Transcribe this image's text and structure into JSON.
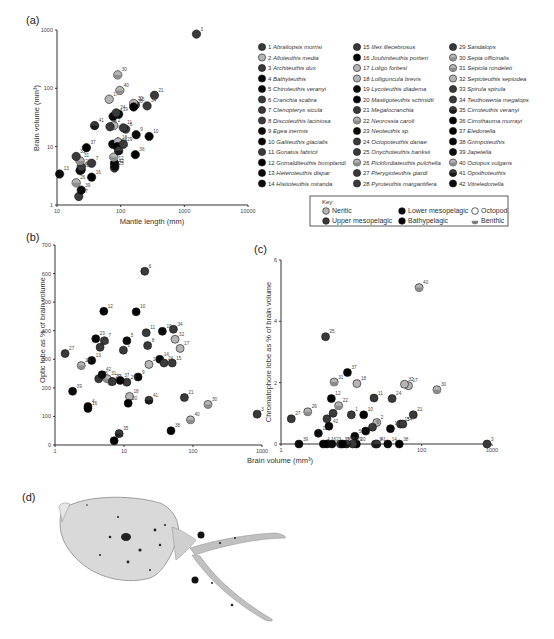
{
  "figure": {
    "panel_labels": {
      "a": "(a)",
      "b": "(b)",
      "c": "(c)",
      "d": "(d)"
    }
  },
  "colors": {
    "neritic": "#b5b5b5",
    "upper_mesopelagic": "#3a3a3a",
    "lower_mesopelagic": "#0a0a0a",
    "bathypelagic": "#000000",
    "outline": "#111111"
  },
  "legend": {
    "species": [
      {
        "n": 1,
        "name": "Abraliopsis morrisi",
        "habitat": "upper"
      },
      {
        "n": 2,
        "name": "Alloteuthis media",
        "habitat": "neritic"
      },
      {
        "n": 3,
        "name": "Architeuthis dux",
        "habitat": "upper"
      },
      {
        "n": 4,
        "name": "Bathyteuthis",
        "habitat": "bathy"
      },
      {
        "n": 5,
        "name": "Chiroteuthis veranyi",
        "habitat": "lower"
      },
      {
        "n": 6,
        "name": "Cranchia scabra",
        "habitat": "upper"
      },
      {
        "n": 7,
        "name": "Ctenopteryx sicula",
        "habitat": "upper"
      },
      {
        "n": 8,
        "name": "Discoteuthis laciniosa",
        "habitat": "upper"
      },
      {
        "n": 9,
        "name": "Egea inermis",
        "habitat": "lower"
      },
      {
        "n": 10,
        "name": "Galiteuthis glacialis",
        "habitat": "bathy"
      },
      {
        "n": 11,
        "name": "Gonatus fabricii",
        "habitat": "upper"
      },
      {
        "n": 12,
        "name": "Grimalditeuthis bomplandi",
        "habitat": "bathy"
      },
      {
        "n": 13,
        "name": "Heteroteuthis dispar",
        "habitat": "lower"
      },
      {
        "n": 14,
        "name": "Histioteuthis miranda",
        "habitat": "lower"
      },
      {
        "n": 15,
        "name": "Illex illecebrosus",
        "habitat": "upper"
      },
      {
        "n": 16,
        "name": "Joubiniteuthis portieri",
        "habitat": "bathy"
      },
      {
        "n": 17,
        "name": "Loligo forbesi",
        "habitat": "neritic"
      },
      {
        "n": 18,
        "name": "Lolliguncula brevis",
        "habitat": "neritic"
      },
      {
        "n": 19,
        "name": "Lycoteuthis diadema",
        "habitat": "lower"
      },
      {
        "n": 20,
        "name": "Mastigoteuthis schmidti",
        "habitat": "bathy"
      },
      {
        "n": 21,
        "name": "Megalocranchia",
        "habitat": "upper"
      },
      {
        "n": 22,
        "name": "Neorossia caroli",
        "habitat": "neritic-benthic"
      },
      {
        "n": 23,
        "name": "Neoteuthis sp.",
        "habitat": "lower"
      },
      {
        "n": 24,
        "name": "Octopoteuthis danae",
        "habitat": "upper"
      },
      {
        "n": 25,
        "name": "Onychoteuthis banksii",
        "habitat": "upper"
      },
      {
        "n": 26,
        "name": "Pickfordiateuthis pulchella",
        "habitat": "neritic-benthic"
      },
      {
        "n": 27,
        "name": "Pterygioteuthis giardi",
        "habitat": "upper"
      },
      {
        "n": 28,
        "name": "Pyroteuthis margaritifera",
        "habitat": "upper"
      },
      {
        "n": 29,
        "name": "Sandalops",
        "habitat": "upper"
      },
      {
        "n": 30,
        "name": "Sepia officinalis",
        "habitat": "neritic-benthic"
      },
      {
        "n": 31,
        "name": "Sepiola rondeleti",
        "habitat": "neritic-benthic"
      },
      {
        "n": 32,
        "name": "Sepioteuthis sepiodea",
        "habitat": "neritic"
      },
      {
        "n": 33,
        "name": "Spirula spirula",
        "habitat": "upper"
      },
      {
        "n": 34,
        "name": "Teuthowenia megalops",
        "habitat": "upper"
      },
      {
        "n": 35,
        "name": "Cirroteuthis veranyi",
        "habitat": "upper-benthic"
      },
      {
        "n": 36,
        "name": "Cirrothauma murrayi",
        "habitat": "bathy"
      },
      {
        "n": 37,
        "name": "Eledonella",
        "habitat": "bathy"
      },
      {
        "n": 38,
        "name": "Grimpoteuthis",
        "habitat": "bathy"
      },
      {
        "n": 39,
        "name": "Japetella",
        "habitat": "lower"
      },
      {
        "n": 40,
        "name": "Octopus vulgaris",
        "habitat": "neritic-benthic"
      },
      {
        "n": 41,
        "name": "Opisthoteuthis",
        "habitat": "upper-benthic"
      },
      {
        "n": 42,
        "name": "Vitreledonella",
        "habitat": "lower"
      }
    ],
    "key": {
      "title": "Key:",
      "items": [
        {
          "label": "Neritic",
          "style": "neritic"
        },
        {
          "label": "Lower mesopelagic",
          "style": "lower"
        },
        {
          "label": "Octopod",
          "style": "octopod"
        },
        {
          "label": "Upper mesopelagic",
          "style": "upper"
        },
        {
          "label": "Bathypelagic",
          "style": "bathy"
        },
        {
          "label": "Benthic",
          "style": "benthic"
        }
      ]
    }
  },
  "chart_data": [
    {
      "id": "a",
      "type": "scatter",
      "title": "(a)",
      "xlabel": "Mantle length (mm)",
      "ylabel": "Brain volume (mm³)",
      "xscale": "log",
      "yscale": "log",
      "xlim": [
        10,
        10000
      ],
      "ylim": [
        1,
        1000
      ],
      "xticks": [
        "10",
        "100",
        "1000",
        "10000"
      ],
      "yticks": [
        "1",
        "10",
        "100",
        "1000"
      ],
      "grid": false,
      "points": [
        {
          "n": 1,
          "x": 100,
          "y": 11
        },
        {
          "n": 2,
          "x": 78,
          "y": 23
        },
        {
          "n": 3,
          "x": 1550,
          "y": 850
        },
        {
          "n": 4,
          "x": 24,
          "y": 4
        },
        {
          "n": 5,
          "x": 75,
          "y": 11
        },
        {
          "n": 6,
          "x": 120,
          "y": 20
        },
        {
          "n": 7,
          "x": 35,
          "y": 5.2
        },
        {
          "n": 8,
          "x": 68,
          "y": 22
        },
        {
          "n": 9,
          "x": 175,
          "y": 16
        },
        {
          "n": 10,
          "x": 280,
          "y": 15
        },
        {
          "n": 11,
          "x": 110,
          "y": 21
        },
        {
          "n": 12,
          "x": 80,
          "y": 5.2
        },
        {
          "n": 13,
          "x": 11,
          "y": 3.4
        },
        {
          "n": 14,
          "x": 76,
          "y": 33
        },
        {
          "n": 15,
          "x": 170,
          "y": 52
        },
        {
          "n": 16,
          "x": 35,
          "y": 3
        },
        {
          "n": 17,
          "x": 66,
          "y": 65
        },
        {
          "n": 18,
          "x": 91,
          "y": 12
        },
        {
          "n": 19,
          "x": 93,
          "y": 36
        },
        {
          "n": 20,
          "x": 88,
          "y": 10
        },
        {
          "n": 21,
          "x": 340,
          "y": 76
        },
        {
          "n": 22,
          "x": 78,
          "y": 6.6
        },
        {
          "n": 23,
          "x": 23,
          "y": 3.9
        },
        {
          "n": 24,
          "x": 85,
          "y": 38
        },
        {
          "n": 25,
          "x": 80,
          "y": 4.3
        },
        {
          "n": 26,
          "x": 20,
          "y": 2.4
        },
        {
          "n": 27,
          "x": 22,
          "y": 1.4
        },
        {
          "n": 28,
          "x": 24,
          "y": 4.5
        },
        {
          "n": 29,
          "x": 110,
          "y": 11
        },
        {
          "n": 30,
          "x": 90,
          "y": 170
        },
        {
          "n": 31,
          "x": 23,
          "y": 5.7
        },
        {
          "n": 32,
          "x": 160,
          "y": 55
        },
        {
          "n": 33,
          "x": 20,
          "y": 6.8
        },
        {
          "n": 34,
          "x": 260,
          "y": 50
        },
        {
          "n": 35,
          "x": 93,
          "y": 8.5
        },
        {
          "n": 36,
          "x": 170,
          "y": 7.3
        },
        {
          "n": 37,
          "x": 29,
          "y": 9.6
        },
        {
          "n": 38,
          "x": 160,
          "y": 48
        },
        {
          "n": 39,
          "x": 24,
          "y": 1.8
        },
        {
          "n": 40,
          "x": 97,
          "y": 92
        },
        {
          "n": 41,
          "x": 39,
          "y": 23
        },
        {
          "n": 42,
          "x": 81,
          "y": 4.6
        }
      ]
    },
    {
      "id": "b",
      "type": "scatter",
      "title": "(b)",
      "xlabel": "Brain volume (mm³)",
      "ylabel": "Optic lobe as % of brain volume",
      "xscale": "log",
      "yscale": "linear",
      "xlim": [
        1,
        1000
      ],
      "ylim": [
        0,
        700
      ],
      "xticks": [
        "1",
        "10",
        "100",
        "1000"
      ],
      "yticks": [
        "0",
        "100",
        "200",
        "300",
        "400",
        "500",
        "600",
        "700"
      ],
      "grid": false,
      "points": [
        {
          "n": 1,
          "x": 9.8,
          "y": 332
        },
        {
          "n": 2,
          "x": 23,
          "y": 282
        },
        {
          "n": 3,
          "x": 850,
          "y": 108
        },
        {
          "n": 4,
          "x": 3,
          "y": 135
        },
        {
          "n": 5,
          "x": 11,
          "y": 365
        },
        {
          "n": 6,
          "x": 20,
          "y": 608
        },
        {
          "n": 7,
          "x": 5.2,
          "y": 365
        },
        {
          "n": 8,
          "x": 22,
          "y": 348
        },
        {
          "n": 9,
          "x": 16,
          "y": 238
        },
        {
          "n": 10,
          "x": 15,
          "y": 466
        },
        {
          "n": 11,
          "x": 21,
          "y": 393
        },
        {
          "n": 12,
          "x": 5.1,
          "y": 468
        },
        {
          "n": 13,
          "x": 3.4,
          "y": 296
        },
        {
          "n": 14,
          "x": 33,
          "y": 300
        },
        {
          "n": 15,
          "x": 50,
          "y": 287
        },
        {
          "n": 16,
          "x": 3,
          "y": 128
        },
        {
          "n": 17,
          "x": 65,
          "y": 338
        },
        {
          "n": 18,
          "x": 12,
          "y": 170
        },
        {
          "n": 19,
          "x": 36,
          "y": 398
        },
        {
          "n": 20,
          "x": 11.5,
          "y": 146
        },
        {
          "n": 21,
          "x": 75,
          "y": 166
        },
        {
          "n": 22,
          "x": 6.6,
          "y": 222
        },
        {
          "n": 23,
          "x": 3.9,
          "y": 372
        },
        {
          "n": 24,
          "x": 38,
          "y": 287
        },
        {
          "n": 25,
          "x": 4.3,
          "y": 232
        },
        {
          "n": 26,
          "x": 2.4,
          "y": 278
        },
        {
          "n": 27,
          "x": 1.4,
          "y": 320
        },
        {
          "n": 28,
          "x": 4.5,
          "y": 342
        },
        {
          "n": 29,
          "x": 11,
          "y": 220
        },
        {
          "n": 30,
          "x": 165,
          "y": 142
        },
        {
          "n": 31,
          "x": 5.7,
          "y": 232
        },
        {
          "n": 32,
          "x": 55,
          "y": 370
        },
        {
          "n": 33,
          "x": 6.8,
          "y": 222
        },
        {
          "n": 34,
          "x": 52,
          "y": 405
        },
        {
          "n": 35,
          "x": 8.5,
          "y": 40
        },
        {
          "n": 36,
          "x": 7.2,
          "y": 15
        },
        {
          "n": 37,
          "x": 8.8,
          "y": 226
        },
        {
          "n": 38,
          "x": 48,
          "y": 50
        },
        {
          "n": 39,
          "x": 1.8,
          "y": 188
        },
        {
          "n": 40,
          "x": 92,
          "y": 88
        },
        {
          "n": 41,
          "x": 23,
          "y": 157
        },
        {
          "n": 42,
          "x": 4.8,
          "y": 246
        }
      ]
    },
    {
      "id": "c",
      "type": "scatter",
      "title": "(c)",
      "xlabel": "Brain volume (mm³)",
      "ylabel": "Chromatophore lobe as % of brain volume",
      "xscale": "log",
      "yscale": "linear",
      "xlim": [
        1,
        1000
      ],
      "ylim": [
        0,
        6
      ],
      "xticks": [
        "1",
        "100",
        "1000"
      ],
      "yticks": [
        "0",
        "2",
        "4",
        "6"
      ],
      "grid": false,
      "points": [
        {
          "n": 1,
          "x": 10,
          "y": 0.95
        },
        {
          "n": 2,
          "x": 23,
          "y": 0.7
        },
        {
          "n": 3,
          "x": 850,
          "y": 0
        },
        {
          "n": 4,
          "x": 4,
          "y": 0
        },
        {
          "n": 5,
          "x": 11.2,
          "y": 0.25
        },
        {
          "n": 6,
          "x": 20,
          "y": 0.55
        },
        {
          "n": 7,
          "x": 5.5,
          "y": 1.0
        },
        {
          "n": 8,
          "x": 22,
          "y": 0
        },
        {
          "n": 9,
          "x": 16,
          "y": 0.42
        },
        {
          "n": 10,
          "x": 15,
          "y": 0.95
        },
        {
          "n": 11,
          "x": 21,
          "y": 1.5
        },
        {
          "n": 12,
          "x": 5.2,
          "y": 1.48
        },
        {
          "n": 13,
          "x": 3.4,
          "y": 0.35
        },
        {
          "n": 14,
          "x": 33,
          "y": 0
        },
        {
          "n": 15,
          "x": 50,
          "y": 0.65
        },
        {
          "n": 16,
          "x": 4.5,
          "y": 0
        },
        {
          "n": 17,
          "x": 65,
          "y": 1.9
        },
        {
          "n": 18,
          "x": 12,
          "y": 1.97
        },
        {
          "n": 19,
          "x": 36,
          "y": 0.5
        },
        {
          "n": 20,
          "x": 11.8,
          "y": 0
        },
        {
          "n": 21,
          "x": 76,
          "y": 0.95
        },
        {
          "n": 22,
          "x": 6.6,
          "y": 1.25
        },
        {
          "n": 23,
          "x": 5.3,
          "y": 0
        },
        {
          "n": 24,
          "x": 38,
          "y": 1.48
        },
        {
          "n": 25,
          "x": 4.3,
          "y": 3.5
        },
        {
          "n": 26,
          "x": 2.4,
          "y": 1.05
        },
        {
          "n": 27,
          "x": 1.4,
          "y": 0.82
        },
        {
          "n": 28,
          "x": 4.5,
          "y": 0.82
        },
        {
          "n": 29,
          "x": 10.5,
          "y": 0
        },
        {
          "n": 30,
          "x": 165,
          "y": 1.77
        },
        {
          "n": 31,
          "x": 5.7,
          "y": 2.02
        },
        {
          "n": 32,
          "x": 57,
          "y": 1.95
        },
        {
          "n": 33,
          "x": 7,
          "y": 0
        },
        {
          "n": 34,
          "x": 54,
          "y": 0.65
        },
        {
          "n": 35,
          "x": 8.5,
          "y": 0
        },
        {
          "n": 36,
          "x": 7.5,
          "y": 0
        },
        {
          "n": 37,
          "x": 8.8,
          "y": 2.33
        },
        {
          "n": 38,
          "x": 48,
          "y": 0
        },
        {
          "n": 39,
          "x": 1.8,
          "y": 0
        },
        {
          "n": 40,
          "x": 92,
          "y": 5.1
        },
        {
          "n": 41,
          "x": 23,
          "y": 0
        },
        {
          "n": 42,
          "x": 4.8,
          "y": 0.58
        }
      ]
    }
  ],
  "photo": {
    "label": "(d)",
    "description": "Photograph of a cranchiid squid with chromatophore spots"
  }
}
